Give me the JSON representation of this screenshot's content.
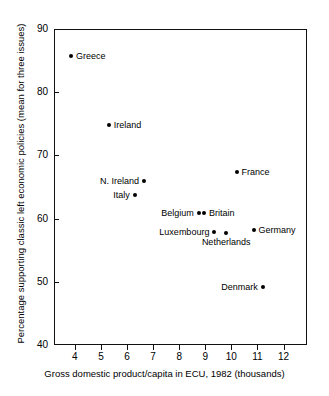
{
  "chart_data": {
    "type": "scatter",
    "title": "",
    "xlabel": "Gross domestic product/capita in ECU, 1982 (thousands)",
    "ylabel": "Percentage supporting classic left economic policies (mean for three issues)",
    "xlim": [
      3.2,
      12.9
    ],
    "ylim": [
      40,
      90
    ],
    "xticks": [
      4,
      5,
      6,
      7,
      8,
      9,
      10,
      11,
      12
    ],
    "yticks": [
      40,
      50,
      60,
      70,
      80,
      90
    ],
    "xtick_labels": [
      "4",
      "5",
      "6",
      "7",
      "8",
      "9",
      "10",
      "11",
      "12"
    ],
    "ytick_labels": [
      "40",
      "50",
      "60",
      "70",
      "80",
      "90"
    ],
    "grid": false,
    "legend": "none",
    "points": [
      {
        "label": "Greece",
        "x": 3.85,
        "y": 85.8,
        "label_pos": "right"
      },
      {
        "label": "Ireland",
        "x": 5.3,
        "y": 74.8,
        "label_pos": "right"
      },
      {
        "label": "N. Ireland",
        "x": 6.65,
        "y": 65.9,
        "label_pos": "left"
      },
      {
        "label": "Italy",
        "x": 6.3,
        "y": 63.7,
        "label_pos": "left"
      },
      {
        "label": "France",
        "x": 10.2,
        "y": 67.3,
        "label_pos": "right"
      },
      {
        "label": "Belgium",
        "x": 8.75,
        "y": 60.9,
        "label_pos": "left"
      },
      {
        "label": "Britain",
        "x": 8.95,
        "y": 60.9,
        "label_pos": "right"
      },
      {
        "label": "Luxembourg",
        "x": 9.35,
        "y": 57.9,
        "label_pos": "left"
      },
      {
        "label": "Netherlands",
        "x": 9.8,
        "y": 57.8,
        "label_pos": "below"
      },
      {
        "label": "Germany",
        "x": 10.85,
        "y": 58.2,
        "label_pos": "right"
      },
      {
        "label": "Denmark",
        "x": 11.2,
        "y": 49.1,
        "label_pos": "left"
      }
    ]
  },
  "colors": {
    "point": "#000000",
    "axis": "#111111",
    "text": "#000000",
    "background": "#ffffff"
  }
}
